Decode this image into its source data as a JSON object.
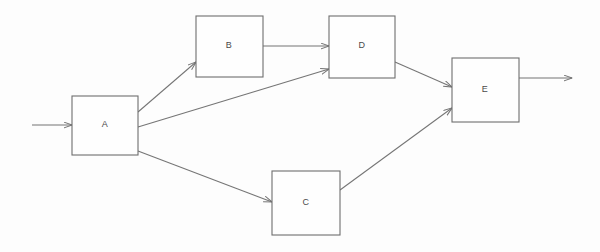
{
  "diagram": {
    "type": "flowchart",
    "title": "",
    "background_color": "#fdfdfd",
    "line_color": "#757575",
    "box_fill_color": "#fefefe",
    "box_stroke_color": "#6e6e6e",
    "label_color": "#4a4a4a",
    "nodes": [
      {
        "id": "A",
        "label": "A",
        "x": 72,
        "y": 96,
        "width": 66,
        "height": 59,
        "cx": 105,
        "cy": 125
      },
      {
        "id": "B",
        "label": "B",
        "x": 196,
        "y": 16,
        "width": 67,
        "height": 61,
        "cx": 229,
        "cy": 46
      },
      {
        "id": "C",
        "label": "C",
        "x": 272,
        "y": 171,
        "width": 68,
        "height": 64,
        "cx": 306,
        "cy": 203
      },
      {
        "id": "D",
        "label": "D",
        "x": 329,
        "y": 16,
        "width": 66,
        "height": 62,
        "cx": 362,
        "cy": 46
      },
      {
        "id": "E",
        "label": "E",
        "x": 452,
        "y": 58,
        "width": 67,
        "height": 64,
        "cx": 485,
        "cy": 90
      }
    ],
    "edges": [
      {
        "id": "input-to-A",
        "from": "input",
        "to": "A",
        "label": "",
        "x1": 32,
        "y1": 125,
        "x2": 72,
        "y2": 125
      },
      {
        "id": "A-to-B",
        "from": "A",
        "to": "B",
        "label": "",
        "x1": 138,
        "y1": 112,
        "x2": 196,
        "y2": 62
      },
      {
        "id": "A-to-D",
        "from": "A",
        "to": "D",
        "label": "",
        "x1": 138,
        "y1": 127,
        "x2": 329,
        "y2": 69
      },
      {
        "id": "A-to-C",
        "from": "A",
        "to": "C",
        "label": "",
        "x1": 138,
        "y1": 151,
        "x2": 272,
        "y2": 202
      },
      {
        "id": "B-to-D",
        "from": "B",
        "to": "D",
        "label": "",
        "x1": 263,
        "y1": 46,
        "x2": 329,
        "y2": 46
      },
      {
        "id": "D-to-E",
        "from": "D",
        "to": "E",
        "label": "",
        "x1": 395,
        "y1": 62,
        "x2": 452,
        "y2": 87
      },
      {
        "id": "C-to-E",
        "from": "C",
        "to": "E",
        "label": "",
        "x1": 340,
        "y1": 190,
        "x2": 452,
        "y2": 108
      },
      {
        "id": "E-to-output",
        "from": "E",
        "to": "output",
        "label": "",
        "x1": 519,
        "y1": 78,
        "x2": 572,
        "y2": 78
      }
    ]
  }
}
